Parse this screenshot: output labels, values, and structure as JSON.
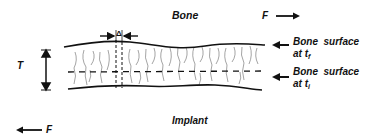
{
  "diagram": {
    "region_labels": {
      "bone": "Bone",
      "implant": "Implant"
    },
    "forces": {
      "top": {
        "label": "F",
        "direction": "right"
      },
      "bottom": {
        "label": "F",
        "direction": "left"
      }
    },
    "thickness": {
      "label": "T"
    },
    "offset": {
      "label": "Δ"
    },
    "surfaces": [
      {
        "line1": "Bone  surface",
        "line2_prefix": "at t",
        "subscript": "f"
      },
      {
        "line1": "Bone  surface",
        "line2_prefix": "at t",
        "subscript": "i"
      }
    ],
    "colors": {
      "ink": "#111111",
      "hatch": "#555555",
      "background": "#ffffff"
    }
  }
}
